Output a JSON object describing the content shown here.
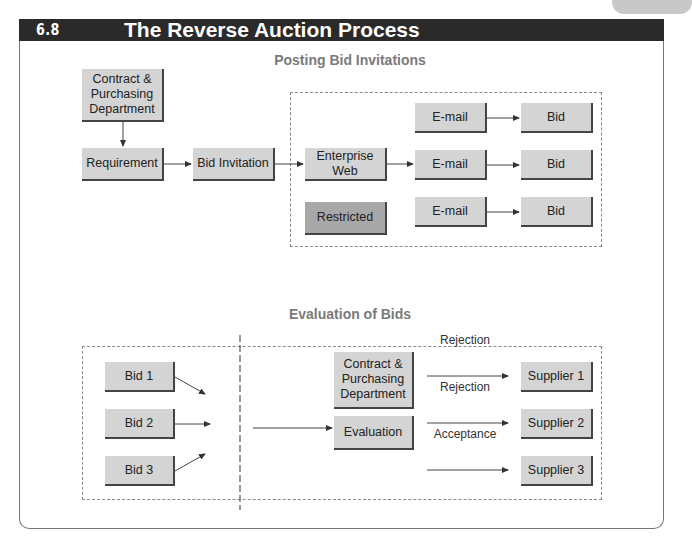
{
  "header": {
    "exhibit": "EXHIBIT 6.8",
    "title": "The Reverse Auction Process"
  },
  "section1": {
    "title": "Posting Bid Invitations",
    "contract_dept": "Contract & Purchasing Department",
    "requirement": "Requirement",
    "bid_invitation": "Bid Invitation",
    "enterprise_web": "Enterprise Web",
    "restricted": "Restricted",
    "emails": [
      "E-mail",
      "E-mail",
      "E-mail"
    ],
    "bids": [
      "Bid",
      "Bid",
      "Bid"
    ]
  },
  "section2": {
    "title": "Evaluation of Bids",
    "bids": [
      "Bid 1",
      "Bid 2",
      "Bid 3"
    ],
    "contract_dept": "Contract & Purchasing Department",
    "evaluation": "Evaluation",
    "outcomes": [
      "Rejection",
      "Rejection",
      "Acceptance"
    ],
    "suppliers": [
      "Supplier 1",
      "Supplier 2",
      "Supplier 3"
    ]
  },
  "colors": {
    "box": "#d4d4d4",
    "restricted": "#a8a8a8",
    "header_bg": "#2a2a2a",
    "section_title": "#7a7a7a"
  }
}
